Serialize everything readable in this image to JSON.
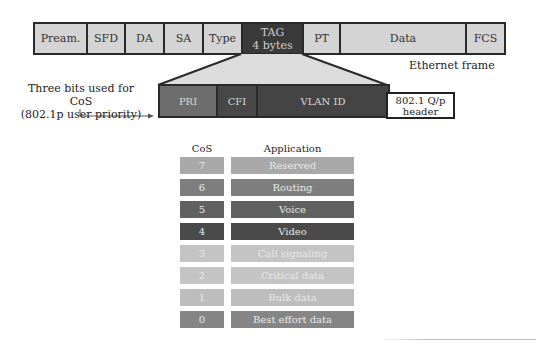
{
  "ethernet_frame": {
    "caption": "Ethernet frame",
    "fields": [
      {
        "label": "Pream.",
        "width": 53,
        "style": "light"
      },
      {
        "label": "SFD",
        "width": 38,
        "style": "light"
      },
      {
        "label": "DA",
        "width": 39,
        "style": "light"
      },
      {
        "label": "SA",
        "width": 39,
        "style": "light"
      },
      {
        "label": "Type",
        "width": 39,
        "style": "light"
      },
      {
        "label": "TAG\n4 bytes",
        "width": 61,
        "style": "dark"
      },
      {
        "label": "PT",
        "width": 37,
        "style": "light"
      },
      {
        "label": "Data",
        "width": 126,
        "style": "light"
      },
      {
        "label": "FCS",
        "width": 37,
        "style": "light"
      }
    ]
  },
  "tag_detail": {
    "fields": [
      {
        "label": "PRI",
        "width": 58,
        "color": "#6d6d6d"
      },
      {
        "label": "CFI",
        "width": 40,
        "color": "#484848"
      },
      {
        "label": "VLAN ID",
        "width": 130,
        "color": "#444444"
      }
    ],
    "header_box": "802.1 Q/p\nheader",
    "annotation_line1": "Three bits used for CoS",
    "annotation_line2": "(802.1p user priority)"
  },
  "cos_table": {
    "col_cos": "CoS",
    "col_application": "Application",
    "rows": [
      {
        "cos": "7",
        "application": "Reserved",
        "color": "#a9a9a9"
      },
      {
        "cos": "6",
        "application": "Routing",
        "color": "#7e7e7e"
      },
      {
        "cos": "5",
        "application": "Voice",
        "color": "#616161"
      },
      {
        "cos": "4",
        "application": "Video",
        "color": "#4a4a4a"
      },
      {
        "cos": "3",
        "application": "Call signaling",
        "color": "#c4c4c4"
      },
      {
        "cos": "2",
        "application": "Critical data",
        "color": "#c4c4c4"
      },
      {
        "cos": "1",
        "application": "Bulk data",
        "color": "#bdbdbd"
      },
      {
        "cos": "0",
        "application": "Best effort data",
        "color": "#858585"
      }
    ]
  },
  "colors": {
    "light_field": "#d4d4d4",
    "dark_field": "#3a3a3a",
    "funnel": "#dcdcdc",
    "border": "#2a2a2a"
  }
}
